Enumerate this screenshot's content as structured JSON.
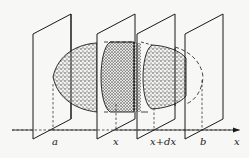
{
  "figure": {
    "axis_label": "x",
    "plane_labels": [
      "a",
      "x",
      "x+dx",
      "b"
    ],
    "colors": {
      "line": "#1a1a1a",
      "background": "#f7f7f5",
      "stipple": "#2a2a2a"
    }
  }
}
